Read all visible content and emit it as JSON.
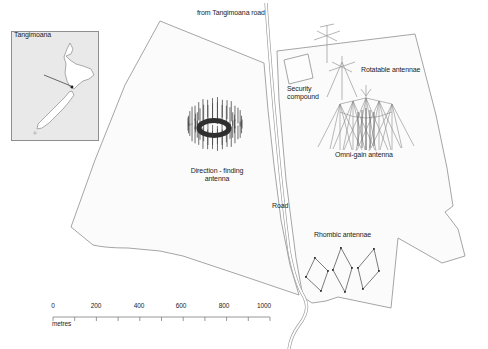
{
  "palette": {
    "boundary_line": "#9b9b9b",
    "road_line": "#9b9b9b",
    "text": "#1c1c1c",
    "parcel_fill": "#fbfbfb",
    "inset_fill": "#e9e9e9",
    "antenna_dark": "#2f2f2f"
  },
  "inset_map": {
    "place_label": "Tangimoana"
  },
  "site_map": {
    "access_road_label": "from Tangimoana road",
    "security_compound_label": "Security compound",
    "rotatable_label": "Rotatable antennae",
    "omni_label": "Omni-gain antenna",
    "df_label": "Direction - finding antenna",
    "road_label": "Road",
    "rhombic_label": "Rhombic antennae"
  },
  "scale_bar": {
    "ticks": [
      "0",
      "200",
      "400",
      "600",
      "800",
      "1000"
    ],
    "unit_label": "metres"
  }
}
